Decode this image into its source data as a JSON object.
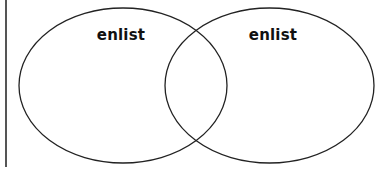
{
  "diagram": {
    "type": "venn",
    "sets": [
      {
        "id": "left",
        "label": "enlist"
      },
      {
        "id": "right",
        "label": "enlist"
      }
    ],
    "colors": {
      "stroke": "#222222",
      "fill": "#ffffff",
      "edge_line": "#555555",
      "text": "#111111"
    }
  }
}
